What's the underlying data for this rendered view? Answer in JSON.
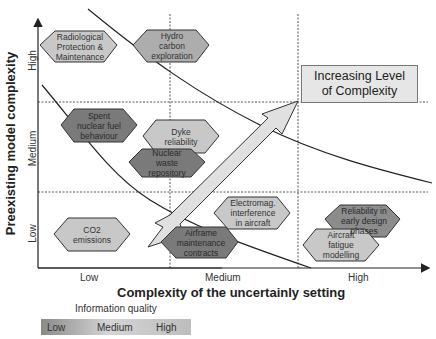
{
  "diagram": {
    "type": "quadrant_diagram",
    "x_axis": {
      "title": "Complexity of the uncertainly setting",
      "ticks": [
        "Low",
        "Medium",
        "High"
      ]
    },
    "y_axis": {
      "title": "Preexisting model complexity",
      "ticks": [
        "Low",
        "Medium",
        "High"
      ]
    },
    "callout": {
      "line1": "Increasing Level",
      "line2": "of Complexity"
    },
    "items": [
      {
        "id": "radiological",
        "lines": [
          "Radiological",
          "Protection &",
          "Maintenance"
        ],
        "shade": "light"
      },
      {
        "id": "hydrocarbon",
        "lines": [
          "Hydro carbon",
          "exploration"
        ],
        "shade": "medium"
      },
      {
        "id": "spent-fuel",
        "lines": [
          "Spent",
          "nuclear fuel",
          "behaviour"
        ],
        "shade": "dark"
      },
      {
        "id": "dyke",
        "lines": [
          "Dyke",
          "reliability"
        ],
        "shade": "light"
      },
      {
        "id": "nuclear-waste",
        "lines": [
          "Nuclear",
          "waste",
          "repository"
        ],
        "shade": "dark"
      },
      {
        "id": "co2",
        "lines": [
          "CO2",
          "emissions"
        ],
        "shade": "light"
      },
      {
        "id": "airframe",
        "lines": [
          "Airframe",
          "maintenance",
          "contracts"
        ],
        "shade": "dark"
      },
      {
        "id": "electromag",
        "lines": [
          "Electromag.",
          "interference",
          "in aircraft"
        ],
        "shade": "light"
      },
      {
        "id": "reliability-design",
        "lines": [
          "Reliability in",
          "early design",
          "phases"
        ],
        "shade": "medium-dark"
      },
      {
        "id": "aircraft-fatigue",
        "lines": [
          "Aircraft",
          "fatigue",
          "modelling"
        ],
        "shade": "light"
      }
    ],
    "legend": {
      "title": "Information quality",
      "levels": [
        "Low",
        "Medium",
        "High"
      ]
    },
    "colors": {
      "light": "#c8c8c8",
      "medium": "#adadad",
      "medium-dark": "#8c8c8c",
      "dark": "#7a7a7a",
      "arrow": "#e0e0e0",
      "callout_bg": "#e6e6e6"
    }
  }
}
